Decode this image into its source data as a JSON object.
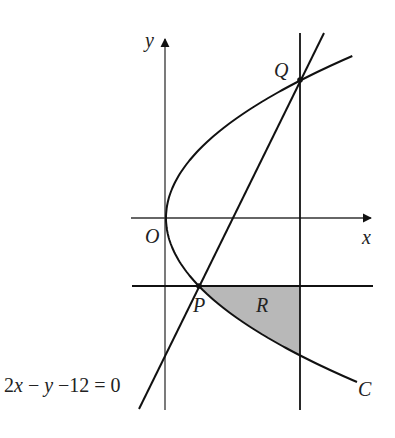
{
  "diagram": {
    "type": "coordinate-geometry",
    "axes": {
      "x_label": "x",
      "y_label": "y",
      "origin_label": "O"
    },
    "points": {
      "P": "P",
      "Q": "Q"
    },
    "region_label": "R",
    "curve_label": "C",
    "line_equation": {
      "part1": "2",
      "part2": "x",
      "part3": " − ",
      "part4": "y",
      "part5": " −12 = 0"
    },
    "colors": {
      "stroke": "#111111",
      "shade": "#b8b8b8"
    }
  }
}
